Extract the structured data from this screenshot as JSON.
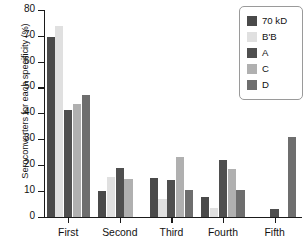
{
  "chart_data": {
    "type": "bar",
    "title": "",
    "xlabel": "",
    "ylabel": "Seroconverters for each specificity (%)",
    "ylim": [
      0,
      80
    ],
    "yticks": [
      0,
      10,
      20,
      30,
      40,
      50,
      60,
      70,
      80
    ],
    "grid": false,
    "legend_position": "top-right",
    "categories": [
      "First",
      "Second",
      "Third",
      "Fourth",
      "Fifth"
    ],
    "series": [
      {
        "name": "70 kD",
        "color": "#4a4a4a",
        "values": [
          69.5,
          10.0,
          14.8,
          7.5,
          0
        ]
      },
      {
        "name": "B'B",
        "color": "#e0e0e0",
        "values": [
          74.0,
          15.5,
          7.0,
          3.3,
          0
        ]
      },
      {
        "name": "A",
        "color": "#4f4f4f",
        "values": [
          41.2,
          19.0,
          14.0,
          22.0,
          2.8
        ]
      },
      {
        "name": "C",
        "color": "#b0b0b0",
        "values": [
          43.8,
          14.7,
          23.0,
          18.3,
          0
        ]
      },
      {
        "name": "D",
        "color": "#6e6e6e",
        "values": [
          47.2,
          0,
          10.5,
          10.3,
          31.0
        ]
      }
    ]
  },
  "legend": {
    "items": [
      {
        "label": "70 kD",
        "color": "#4a4a4a"
      },
      {
        "label": "B'B",
        "color": "#e0e0e0"
      },
      {
        "label": "A",
        "color": "#4f4f4f"
      },
      {
        "label": "C",
        "color": "#b0b0b0"
      },
      {
        "label": "D",
        "color": "#6e6e6e"
      }
    ]
  },
  "axes": {
    "y_title": "Seroconverters for each specificity (%)"
  }
}
